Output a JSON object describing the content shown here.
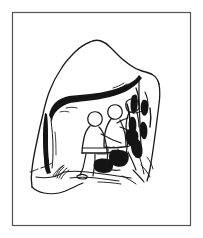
{
  "document": {
    "title": "Cave Shelter Sketch",
    "media": "pen-and-ink line drawing",
    "background_color": "#ffffff",
    "ink_color": "#1a1a1a"
  },
  "frame": {
    "name": "image-border",
    "stroke_color": "#555555",
    "stroke_width": 1.2,
    "x": 12.5,
    "y": 12.5,
    "width": 178,
    "height": 213
  },
  "illustration": {
    "name": "cave-shelter-scene",
    "subject": "three figures seated inside a rock shelter",
    "alt_text": "Line drawing of three human figures sitting and working inside the mouth of a cave or rock overhang",
    "elements": [
      {
        "name": "rock-mass-outline",
        "description": "outer contour of the boulder or rock outcrop",
        "stroke_width": 1.3
      },
      {
        "name": "cave-arch-overhang",
        "description": "thick dark band forming the underside of the cave opening",
        "stroke_width": 2.6
      },
      {
        "name": "left-cave-wall",
        "description": "left interior wall of the shelter with vertical shading",
        "stroke_width": 1.2
      },
      {
        "name": "right-cave-wall",
        "description": "right interior wall with heavy dark hatching",
        "stroke_width": 1.2
      },
      {
        "name": "figure-left-seated",
        "description": "seated figure in profile facing right",
        "stroke_width": 1.2
      },
      {
        "name": "figure-middle-seated",
        "description": "middle seated figure bent forward",
        "stroke_width": 1.2
      },
      {
        "name": "figure-right-standing",
        "description": "right figure leaning toward the cave wall",
        "stroke_width": 1.2
      },
      {
        "name": "cave-floor-ground",
        "description": "sketchy rocky ground line at base of shelter",
        "stroke_width": 1.1
      }
    ]
  }
}
